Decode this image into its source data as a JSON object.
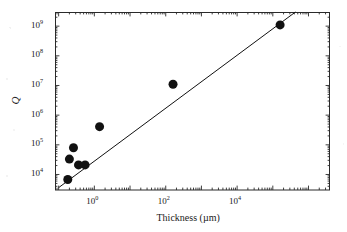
{
  "chart_data": {
    "type": "scatter",
    "title": "",
    "xlabel": "Thickness (µm)",
    "ylabel": "Q",
    "xscale": "log",
    "yscale": "log",
    "xlim": [
      0.079,
      4000000
    ],
    "ylim": [
      3000,
      3000000000
    ],
    "grid": false,
    "legend": null,
    "xticks": [
      {
        "value": 1,
        "label": "10",
        "exponent": "0"
      },
      {
        "value": 100,
        "label": "10",
        "exponent": "2"
      },
      {
        "value": 10000,
        "label": "10",
        "exponent": "4"
      }
    ],
    "yticks": [
      {
        "value": 10000,
        "label": "10",
        "exponent": "4"
      },
      {
        "value": 100000,
        "label": "10",
        "exponent": "5"
      },
      {
        "value": 1000000,
        "label": "10",
        "exponent": "6"
      },
      {
        "value": 10000000,
        "label": "10",
        "exponent": "7"
      },
      {
        "value": 100000000,
        "label": "10",
        "exponent": "8"
      },
      {
        "value": 1000000000,
        "label": "10",
        "exponent": "9"
      }
    ],
    "minor_ticks": true,
    "points": [
      {
        "x": 0.18,
        "y": 6800
      },
      {
        "x": 0.2,
        "y": 33000
      },
      {
        "x": 0.26,
        "y": 80000
      },
      {
        "x": 0.36,
        "y": 21000
      },
      {
        "x": 0.55,
        "y": 21000
      },
      {
        "x": 1.4,
        "y": 410000
      },
      {
        "x": 160,
        "y": 11000000
      },
      {
        "x": 160000,
        "y": 1100000000
      }
    ],
    "marker": {
      "shape": "circle",
      "color": "#111111",
      "size_px": 9
    },
    "fit_line": {
      "type": "power-law",
      "color": "#111111",
      "width_px": 1,
      "x_start": 0.1,
      "y_start": 3600,
      "x_end": 430000,
      "y_end": 3000000000
    }
  },
  "axes": {
    "x_title": "Thickness (µm)",
    "y_title": "Q"
  },
  "geometry": {
    "frame": {
      "left": 55,
      "top": 12,
      "right": 330,
      "bottom": 190
    }
  }
}
